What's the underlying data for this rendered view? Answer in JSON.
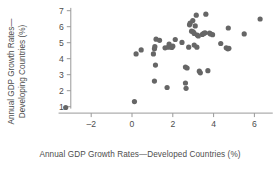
{
  "chart_data": {
    "type": "scatter",
    "title": "",
    "xlabel": "Annual GDP Growth Rates—Developed Countries (%)",
    "ylabel_line1": "Annual GDP Growth Rates—",
    "ylabel_line2": "Developing Countries (%)",
    "ylabel": "Annual GDP Growth Rates—Developing Countries (%)",
    "xlim": [
      -3.6,
      6.9
    ],
    "ylim": [
      0.6,
      7.3
    ],
    "xticks": [
      -2,
      0,
      2,
      4,
      6
    ],
    "xticklabels": [
      "–2",
      "0",
      "2",
      "4",
      "6"
    ],
    "yticks": [
      1,
      2,
      3,
      4,
      5,
      6,
      7
    ],
    "yticklabels": [
      "1",
      "2",
      "3",
      "4",
      "5",
      "6",
      "7"
    ],
    "grid": false,
    "legend": false,
    "marker_color": "#666666",
    "axis_color": "#999999",
    "marker_size": 2.6,
    "series": [
      {
        "name": "Countries",
        "points": [
          [
            -3.25,
            0.95
          ],
          [
            0.12,
            1.32
          ],
          [
            0.2,
            4.3
          ],
          [
            0.45,
            4.55
          ],
          [
            1.05,
            4.3
          ],
          [
            1.1,
            4.62
          ],
          [
            1.12,
            4.75
          ],
          [
            1.18,
            5.22
          ],
          [
            1.15,
            3.6
          ],
          [
            1.1,
            2.6
          ],
          [
            1.35,
            5.15
          ],
          [
            1.62,
            4.68
          ],
          [
            1.78,
            4.72
          ],
          [
            1.82,
            4.92
          ],
          [
            1.95,
            4.7
          ],
          [
            2.0,
            4.78
          ],
          [
            1.72,
            2.2
          ],
          [
            2.12,
            5.2
          ],
          [
            2.45,
            5.02
          ],
          [
            2.62,
            3.48
          ],
          [
            2.7,
            3.42
          ],
          [
            2.62,
            2.48
          ],
          [
            2.65,
            2.15
          ],
          [
            2.78,
            4.72
          ],
          [
            2.82,
            6.12
          ],
          [
            2.85,
            6.22
          ],
          [
            2.92,
            5.72
          ],
          [
            3.0,
            5.68
          ],
          [
            3.05,
            5.58
          ],
          [
            2.98,
            6.38
          ],
          [
            3.1,
            6.05
          ],
          [
            3.15,
            6.72
          ],
          [
            3.2,
            5.48
          ],
          [
            3.25,
            5.42
          ],
          [
            3.05,
            4.85
          ],
          [
            3.18,
            4.72
          ],
          [
            3.3,
            3.22
          ],
          [
            3.35,
            3.12
          ],
          [
            3.45,
            5.52
          ],
          [
            3.52,
            5.58
          ],
          [
            3.58,
            5.62
          ],
          [
            3.62,
            6.78
          ],
          [
            3.72,
            3.25
          ],
          [
            3.8,
            5.6
          ],
          [
            3.85,
            5.55
          ],
          [
            3.95,
            5.5
          ],
          [
            4.35,
            4.95
          ],
          [
            4.62,
            4.68
          ],
          [
            4.7,
            4.62
          ],
          [
            4.75,
            4.65
          ],
          [
            4.72,
            5.92
          ],
          [
            5.5,
            5.55
          ],
          [
            6.28,
            6.48
          ]
        ]
      }
    ]
  }
}
